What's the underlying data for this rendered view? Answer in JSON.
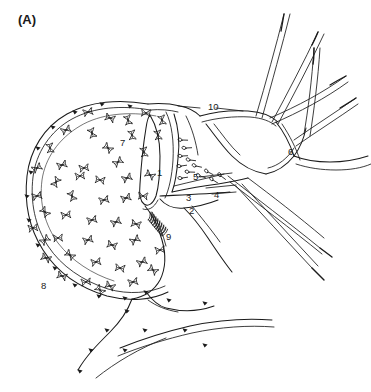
{
  "figure": {
    "panel_label": "(A)",
    "background_color": "#ffffff",
    "ink_color": "#1b1b1b",
    "width": 371,
    "height": 392,
    "style": "hand-drawn line illustration"
  },
  "labels": [
    {
      "id": "1",
      "text": "1",
      "x": 157,
      "y": 176
    },
    {
      "id": "2",
      "text": "2",
      "x": 189,
      "y": 214
    },
    {
      "id": "3",
      "text": "3",
      "x": 186,
      "y": 201
    },
    {
      "id": "4",
      "text": "4",
      "x": 214,
      "y": 198
    },
    {
      "id": "5",
      "text": "5",
      "x": 193,
      "y": 180
    },
    {
      "id": "6",
      "text": "6",
      "x": 288,
      "y": 155
    },
    {
      "id": "7",
      "text": "7",
      "x": 120,
      "y": 146
    },
    {
      "id": "8",
      "text": "8",
      "x": 41,
      "y": 289
    },
    {
      "id": "9",
      "text": "9",
      "x": 166,
      "y": 240
    },
    {
      "id": "10",
      "text": "10",
      "x": 208,
      "y": 110
    }
  ],
  "leader_lines": [
    {
      "from_label": "10",
      "x1": 216,
      "y1": 108,
      "x2": 243,
      "y2": 111
    },
    {
      "from_label": "10",
      "x1": 200,
      "y1": 108,
      "x2": 178,
      "y2": 106
    },
    {
      "from_label": "4",
      "x1": 212,
      "y1": 194,
      "x2": 236,
      "y2": 192
    },
    {
      "from_label": "5",
      "x1": 200,
      "y1": 177,
      "x2": 232,
      "y2": 173
    }
  ],
  "boundary_nodes": [
    {
      "x": 130,
      "y": 106
    },
    {
      "x": 102,
      "y": 104
    },
    {
      "x": 75,
      "y": 112
    },
    {
      "x": 53,
      "y": 127
    },
    {
      "x": 38,
      "y": 148
    },
    {
      "x": 31,
      "y": 172
    },
    {
      "x": 27,
      "y": 196
    },
    {
      "x": 29,
      "y": 220
    },
    {
      "x": 38,
      "y": 245
    },
    {
      "x": 55,
      "y": 268
    },
    {
      "x": 75,
      "y": 285
    },
    {
      "x": 99,
      "y": 296
    },
    {
      "x": 125,
      "y": 298
    },
    {
      "x": 146,
      "y": 292
    },
    {
      "x": 127,
      "y": 311
    },
    {
      "x": 107,
      "y": 330
    },
    {
      "x": 91,
      "y": 350
    },
    {
      "x": 80,
      "y": 371
    },
    {
      "x": 169,
      "y": 300
    },
    {
      "x": 205,
      "y": 303
    },
    {
      "x": 145,
      "y": 330
    },
    {
      "x": 125,
      "y": 350
    },
    {
      "x": 185,
      "y": 330
    },
    {
      "x": 205,
      "y": 345
    }
  ],
  "chromosome_glyphs": [
    {
      "x": 88,
      "y": 112,
      "r": -15
    },
    {
      "x": 110,
      "y": 118,
      "r": 20
    },
    {
      "x": 146,
      "y": 113,
      "r": 5
    },
    {
      "x": 66,
      "y": 130,
      "r": -25
    },
    {
      "x": 92,
      "y": 133,
      "r": 70
    },
    {
      "x": 132,
      "y": 135,
      "r": 80
    },
    {
      "x": 158,
      "y": 135,
      "r": 80
    },
    {
      "x": 50,
      "y": 148,
      "r": 80
    },
    {
      "x": 108,
      "y": 148,
      "r": 40
    },
    {
      "x": 144,
      "y": 152,
      "r": 80
    },
    {
      "x": 37,
      "y": 168,
      "r": -30
    },
    {
      "x": 62,
      "y": 165,
      "r": -20
    },
    {
      "x": 84,
      "y": 168,
      "r": -10
    },
    {
      "x": 118,
      "y": 162,
      "r": -35
    },
    {
      "x": 56,
      "y": 182,
      "r": -60
    },
    {
      "x": 80,
      "y": 176,
      "r": -8
    },
    {
      "x": 100,
      "y": 180,
      "r": 10
    },
    {
      "x": 127,
      "y": 178,
      "r": -25
    },
    {
      "x": 150,
      "y": 175,
      "r": 30
    },
    {
      "x": 37,
      "y": 196,
      "r": -15
    },
    {
      "x": 72,
      "y": 196,
      "r": 65
    },
    {
      "x": 104,
      "y": 200,
      "r": -15
    },
    {
      "x": 126,
      "y": 198,
      "r": -20
    },
    {
      "x": 143,
      "y": 196,
      "r": 5
    },
    {
      "x": 45,
      "y": 212,
      "r": 50
    },
    {
      "x": 66,
      "y": 215,
      "r": -10
    },
    {
      "x": 92,
      "y": 220,
      "r": -15
    },
    {
      "x": 116,
      "y": 222,
      "r": -25
    },
    {
      "x": 136,
      "y": 224,
      "r": 15
    },
    {
      "x": 33,
      "y": 228,
      "r": -10
    },
    {
      "x": 58,
      "y": 238,
      "r": -5
    },
    {
      "x": 88,
      "y": 240,
      "r": -18
    },
    {
      "x": 112,
      "y": 245,
      "r": 18
    },
    {
      "x": 135,
      "y": 240,
      "r": -30
    },
    {
      "x": 46,
      "y": 258,
      "r": 25
    },
    {
      "x": 70,
      "y": 255,
      "r": 40
    },
    {
      "x": 96,
      "y": 262,
      "r": -12
    },
    {
      "x": 120,
      "y": 268,
      "r": 10
    },
    {
      "x": 142,
      "y": 262,
      "r": -25
    },
    {
      "x": 62,
      "y": 276,
      "r": 20
    },
    {
      "x": 86,
      "y": 282,
      "r": -8
    },
    {
      "x": 110,
      "y": 286,
      "r": 25
    },
    {
      "x": 133,
      "y": 282,
      "r": -14
    },
    {
      "x": 153,
      "y": 270,
      "r": 35
    },
    {
      "x": 45,
      "y": 240,
      "r": -40
    },
    {
      "x": 100,
      "y": 290,
      "r": 45
    },
    {
      "x": 160,
      "y": 250,
      "r": -10
    },
    {
      "x": 128,
      "y": 120,
      "r": 75
    },
    {
      "x": 162,
      "y": 120,
      "r": 78
    }
  ],
  "oocyte_glyphs": [
    {
      "x": 182,
      "y": 140,
      "a": 205
    },
    {
      "x": 186,
      "y": 148,
      "a": 200
    },
    {
      "x": 182,
      "y": 156,
      "a": 200
    },
    {
      "x": 190,
      "y": 160,
      "a": 210
    },
    {
      "x": 181,
      "y": 166,
      "a": 195
    },
    {
      "x": 189,
      "y": 172,
      "a": 205
    },
    {
      "x": 182,
      "y": 178,
      "a": 195
    },
    {
      "x": 196,
      "y": 166,
      "a": 215
    },
    {
      "x": 200,
      "y": 176,
      "a": 220
    },
    {
      "x": 208,
      "y": 172,
      "a": 230
    },
    {
      "x": 213,
      "y": 180,
      "a": 235
    },
    {
      "x": 221,
      "y": 176,
      "a": 240
    }
  ],
  "fringe_papillae": {
    "count": 9,
    "origin_x": 152,
    "origin_y": 212,
    "note": "finger-like projections along lower inner duct"
  },
  "tubules": {
    "upper_right_count": 5,
    "lower_right_count": 3,
    "bottom_count": 2,
    "description": "tapering tubules with darkened pointed tips"
  }
}
